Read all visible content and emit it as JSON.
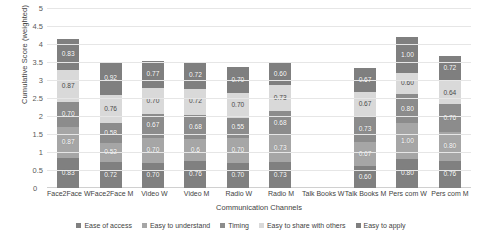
{
  "chart_data": {
    "type": "bar",
    "stacked": true,
    "title": "",
    "xlabel": "Communication Channels",
    "ylabel": "Cumulative Score (weighted)",
    "ylim": [
      0,
      5
    ],
    "ytick_labels": [
      "0",
      "0.5",
      "1",
      "1.5",
      "2",
      "2.5",
      "3",
      "3.5",
      "4",
      "4.5",
      "5"
    ],
    "ytick_values": [
      0,
      0.5,
      1,
      1.5,
      2,
      2.5,
      3,
      3.5,
      4,
      4.5,
      5
    ],
    "grid": true,
    "legend_position": "bottom",
    "categories": [
      "Face2Face W",
      "Face2Face M",
      "Video W",
      "Video M",
      "Radio W",
      "Radio M",
      "Talk Books W",
      "Talk Books M",
      "Pers com W",
      "Pers com M"
    ],
    "series": [
      {
        "name": "Ease of access",
        "color": "#808080",
        "values": [
          0.83,
          0.72,
          0.7,
          0.76,
          0.7,
          0.73,
          null,
          0.6,
          0.8,
          0.76
        ],
        "labels": [
          "0.83",
          "0.72",
          "0.70",
          "0.76",
          "0.70",
          "0.73",
          "",
          "0.60",
          "0.80",
          "0.76"
        ]
      },
      {
        "name": "Easy to understand",
        "color": "#a6a6a6",
        "values": [
          0.87,
          0.52,
          0.7,
          0.6,
          0.7,
          0.73,
          null,
          0.67,
          1.0,
          0.8
        ],
        "labels": [
          "0.87",
          "0.52",
          "0.70",
          "0.6",
          "0.70",
          "0.73",
          "",
          "0.67",
          "1.00",
          "0.80"
        ]
      },
      {
        "name": "Timing",
        "color": "#8c8c8c",
        "values": [
          0.7,
          0.58,
          0.67,
          0.68,
          0.55,
          0.68,
          null,
          0.73,
          0.8,
          0.76
        ],
        "labels": [
          "0.70",
          "0.58",
          "0.67",
          "0.68",
          "0.55",
          "0.68",
          "",
          "0.73",
          "0.80",
          "0.76"
        ]
      },
      {
        "name": "Easy to share with others",
        "color": "#d9d9d9",
        "values": [
          0.87,
          0.76,
          0.7,
          0.72,
          0.7,
          0.73,
          null,
          0.67,
          0.6,
          0.64
        ],
        "labels": [
          "0.87",
          "0.76",
          "0.70",
          "0.72",
          "0.70",
          "0.73",
          "",
          "0.67",
          "0.60",
          "0.64"
        ]
      },
      {
        "name": "Easy to apply",
        "color": "#7f7f7f",
        "values": [
          0.87,
          0.92,
          0.77,
          0.72,
          0.7,
          0.6,
          null,
          0.67,
          1.0,
          0.72
        ],
        "labels": [
          "0.83",
          "0.92",
          "0.77",
          "0.72",
          "0.70",
          "0.60",
          "",
          "0.67",
          "1.00",
          "0.72"
        ]
      }
    ]
  },
  "axis": {
    "zero_label": "0"
  }
}
